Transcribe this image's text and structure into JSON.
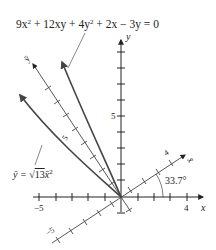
{
  "equation": "9x² + 12xy + 4y² + 2x − 3y = 0",
  "equation_parts": {
    "a": "9x",
    "b": " + 12xy + 4y",
    "c": " + 2x − 3y = 0",
    "sup": "2"
  },
  "curve_label": {
    "lhs": "ȳ = ",
    "sqrt": "√",
    "radicand": "13",
    "rhs": "x̄",
    "sup": "2"
  },
  "axes": {
    "x_label": "x",
    "y_label": "y",
    "xbar_label": "x̄",
    "ybar_label": "ȳ",
    "x_ticks": {
      "neg": "−5",
      "pos": "4"
    },
    "y_ticks": {
      "pos": "5"
    },
    "xbar_ticks": {
      "pos": "4"
    },
    "ybar_ticks": {
      "pos": "5",
      "neg": "−5"
    }
  },
  "angle_label": "33.7°",
  "colors": {
    "axis": "#222222",
    "curve": "#444444",
    "leader": "#555555"
  }
}
